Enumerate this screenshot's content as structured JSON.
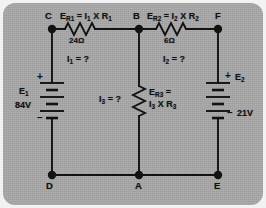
{
  "figure": {
    "kind": "electrical-circuit-schematic",
    "background_color": "#a8a8a8",
    "outer_color": "#f2f2f2",
    "line_color": "#121212"
  },
  "nodes": {
    "top_left": "C",
    "top_middle": "B",
    "top_right": "F",
    "bottom_left": "D",
    "bottom_middle": "A",
    "bottom_right": "E"
  },
  "sources": [
    {
      "id": "E1",
      "name": "E",
      "name_sub": "1",
      "value": "84V",
      "plus": "+",
      "minus": "–",
      "position": "left-branch-C-to-D"
    },
    {
      "id": "E2",
      "name": "E",
      "name_sub": "2",
      "value": "21V",
      "plus": "+",
      "minus": "–",
      "position": "right-branch-F-to-E"
    }
  ],
  "resistors": [
    {
      "id": "R1",
      "equation_main": "E",
      "equation_sub": "R1",
      "equation_rest": " = I",
      "equation_sub2": "1",
      "equation_tail": " X R",
      "equation_sub3": "1",
      "equation_text": "E_R1 = I_1 X R_1",
      "value": "24Ω",
      "branch": "C-to-B",
      "orientation": "horizontal"
    },
    {
      "id": "R2",
      "equation_text": "E_R2 = I_2 X R_2",
      "value": "6Ω",
      "branch": "B-to-F",
      "orientation": "horizontal"
    },
    {
      "id": "R3",
      "equation_line1": "E_R3 =",
      "equation_line2": "I_3 X R_3",
      "value": "",
      "branch": "B-to-A",
      "orientation": "vertical"
    }
  ],
  "currents": [
    {
      "id": "I1",
      "label": "I",
      "sub": "1",
      "equals": " = ?",
      "branch": "C-to-B"
    },
    {
      "id": "I2",
      "label": "I",
      "sub": "2",
      "equals": " = ?",
      "branch": "B-to-F"
    },
    {
      "id": "I3",
      "label": "I",
      "sub": "3",
      "equals": " = ?",
      "branch": "B-to-A"
    }
  ],
  "labels": {
    "er1_e": "E",
    "er1_sub": "R1",
    "er1_mid": " = I",
    "er1_sub2": "1",
    "er1_x": " X R",
    "er1_sub3": "1",
    "er2_e": "E",
    "er2_sub": "R2",
    "er2_mid": " = I",
    "er2_sub2": "2",
    "er2_x": " X R",
    "er2_sub3": "2",
    "er3_e": "E",
    "er3_sub": "R3",
    "er3_eq": " =",
    "er3_i": "I",
    "er3_isub": "3",
    "er3_x": " X R",
    "er3_rsub": "3",
    "r1_value": "24Ω",
    "r2_value": "6Ω",
    "i1_i": "I",
    "i1_sub": "1",
    "i1_tail": " = ?",
    "i2_i": "I",
    "i2_sub": "2",
    "i2_tail": " = ?",
    "i3_i": "I",
    "i3_sub": "3",
    "i3_tail": " = ?",
    "e1_e": "E",
    "e1_sub": "1",
    "e1_value": "84V",
    "e2_e": "E",
    "e2_sub": "2",
    "e2_value": "21V",
    "plus": "+",
    "minus": "–",
    "node_c": "C",
    "node_b": "B",
    "node_f": "F",
    "node_d": "D",
    "node_a": "A",
    "node_e": "E"
  }
}
